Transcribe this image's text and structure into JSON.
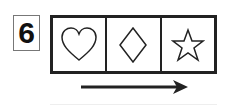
{
  "item": {
    "number": "6",
    "shapes": [
      "heart-icon",
      "diamond-icon",
      "star-icon"
    ],
    "arrow_direction": "right"
  }
}
